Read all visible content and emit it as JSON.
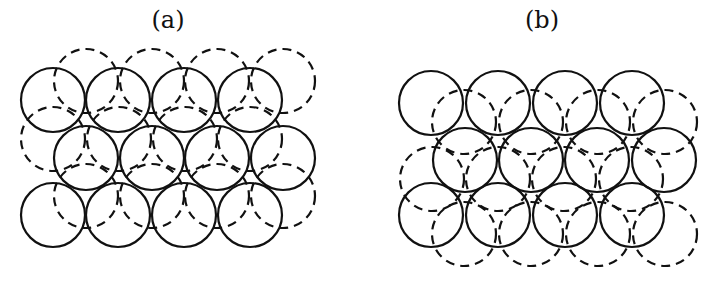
{
  "panels": [
    {
      "label": "(a)",
      "label_x": 168,
      "radius": 32,
      "solid_circles": [
        [
          53,
          100
        ],
        [
          118,
          100
        ],
        [
          184,
          100
        ],
        [
          250,
          100
        ],
        [
          86,
          158
        ],
        [
          152,
          158
        ],
        [
          217,
          158
        ],
        [
          283,
          158
        ],
        [
          53,
          215
        ],
        [
          118,
          215
        ],
        [
          184,
          215
        ],
        [
          250,
          215
        ]
      ],
      "dashed_offset": [
        33,
        -19
      ],
      "dashed_circles": [
        [
          86,
          81
        ],
        [
          152,
          81
        ],
        [
          217,
          81
        ],
        [
          283,
          81
        ],
        [
          53,
          139
        ],
        [
          119,
          139
        ],
        [
          185,
          139
        ],
        [
          250,
          139
        ],
        [
          86,
          196
        ],
        [
          152,
          196
        ],
        [
          217,
          196
        ],
        [
          283,
          196
        ]
      ]
    },
    {
      "label": "(b)",
      "label_x": 542,
      "radius": 32,
      "solid_circles": [
        [
          431,
          103
        ],
        [
          498,
          103
        ],
        [
          565,
          103
        ],
        [
          632,
          103
        ],
        [
          465,
          160
        ],
        [
          531,
          160
        ],
        [
          597,
          160
        ],
        [
          664,
          160
        ],
        [
          431,
          215
        ],
        [
          498,
          215
        ],
        [
          565,
          215
        ],
        [
          632,
          215
        ]
      ],
      "dashed_offset": [
        33,
        19
      ],
      "dashed_circles": [
        [
          464,
          122
        ],
        [
          531,
          122
        ],
        [
          598,
          122
        ],
        [
          665,
          122
        ],
        [
          432,
          179
        ],
        [
          498,
          179
        ],
        [
          564,
          179
        ],
        [
          631,
          179
        ],
        [
          464,
          234
        ],
        [
          531,
          234
        ],
        [
          598,
          234
        ],
        [
          665,
          234
        ]
      ]
    }
  ],
  "colors": {
    "stroke": "#111111",
    "background": "#ffffff"
  }
}
